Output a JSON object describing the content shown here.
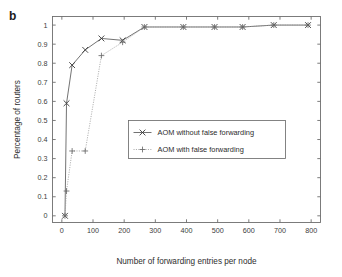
{
  "panel": {
    "label": "b"
  },
  "chart_data": {
    "type": "line",
    "title": "",
    "xlabel": "Number of forwarding entries per node",
    "ylabel": "Percentage of routers",
    "xlim": [
      -30,
      830
    ],
    "ylim": [
      -0.035,
      1.045
    ],
    "xticks": [
      0,
      100,
      200,
      300,
      400,
      500,
      600,
      700,
      800
    ],
    "xticklabels": [
      "0",
      "100",
      "200",
      "300",
      "400",
      "500",
      "600",
      "700",
      "800"
    ],
    "yticks": [
      0,
      0.1,
      0.2,
      0.3,
      0.4,
      0.5,
      0.6,
      0.7,
      0.8,
      0.9,
      1
    ],
    "yticklabels": [
      "0",
      "0.1",
      "0.2",
      "0.3",
      "0.4",
      "0.5",
      "0.6",
      "0.7",
      "0.8",
      "0.9",
      "1"
    ],
    "grid": false,
    "legend_position": "center",
    "series": [
      {
        "name": "AOM without false forwarding",
        "marker": "x",
        "linestyle": "solid",
        "x": [
          10,
          15,
          33,
          75,
          127,
          195,
          265,
          390,
          490,
          580,
          680,
          790
        ],
        "y": [
          0.0,
          0.59,
          0.79,
          0.87,
          0.93,
          0.92,
          0.99,
          0.99,
          0.99,
          0.99,
          1.0,
          1.0
        ]
      },
      {
        "name": "AOM with false forwarding",
        "marker": "+",
        "linestyle": "dotted",
        "x": [
          10,
          15,
          33,
          75,
          127,
          195,
          265,
          390,
          490,
          580,
          680,
          790
        ],
        "y": [
          0.0,
          0.13,
          0.34,
          0.34,
          0.84,
          0.91,
          0.99,
          0.99,
          0.99,
          0.99,
          1.0,
          1.0
        ]
      }
    ]
  },
  "legend": {
    "entries": [
      {
        "label": "AOM without false forwarding",
        "marker": "x",
        "linestyle": "solid"
      },
      {
        "label": "AOM with false forwarding",
        "marker": "+",
        "linestyle": "dotted"
      }
    ]
  }
}
